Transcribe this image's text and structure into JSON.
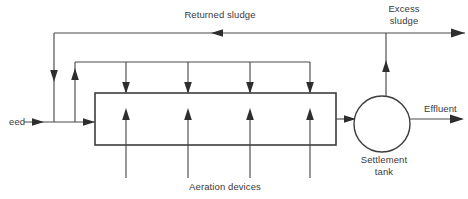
{
  "diagram": {
    "labels": {
      "returned_sludge": "Returned sludge",
      "excess_sludge_line1": "Excess",
      "excess_sludge_line2": "sludge",
      "feed": "eed",
      "effluent": "Effluent",
      "settlement_tank_line1": "Settlement",
      "settlement_tank_line2": "tank",
      "aeration_devices": "Aeration devices"
    },
    "colors": {
      "background": "#ffffff",
      "line": "#4a4a4a",
      "line_dark": "#3d3d3d",
      "arrow": "#2e2e2e",
      "text": "#3a3a3a"
    },
    "nodes": [
      {
        "id": "aeration-tank",
        "shape": "rectangle",
        "x": 95,
        "y": 93,
        "width": 241,
        "height": 52
      },
      {
        "id": "settlement-tank",
        "shape": "circle",
        "cx": 382,
        "cy": 124,
        "r": 28
      }
    ],
    "aeration_riser_x": [
      119,
      186,
      250,
      310
    ],
    "air_manifold_drop_x": [
      126,
      188,
      250,
      310
    ],
    "flows": [
      {
        "id": "feed-inlet",
        "direction": "right",
        "label": "eed"
      },
      {
        "id": "returned-sludge-loop",
        "direction": "left",
        "label": "Returned sludge"
      },
      {
        "id": "excess-sludge-outlet",
        "direction": "right",
        "label": "Excess sludge"
      },
      {
        "id": "effluent-outlet",
        "direction": "right",
        "label": "Effluent"
      },
      {
        "id": "tank-to-settlement",
        "direction": "right",
        "label": ""
      }
    ]
  }
}
